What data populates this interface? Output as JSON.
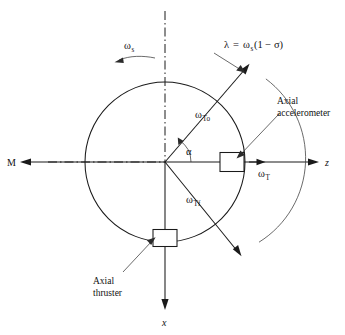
{
  "figure": {
    "type": "engineering-diagram",
    "background_color": "#ffffff",
    "line_color": "#1a1a1a",
    "thin_line_color": "#3a3a3a"
  },
  "axes": {
    "z_axis_label": "z",
    "x_axis_label": "x",
    "moment_label": "M",
    "spin_axis_dashdot": true
  },
  "labels": {
    "spin_rate": "ω",
    "spin_rate_sub": "s",
    "lambda_expression": "λ = ω (1 − σ)",
    "lambda_symbol": "λ",
    "lambda_equals": "=",
    "lambda_omega": "ω",
    "lambda_omega_sub": "s",
    "lambda_tail": "(1 − σ)",
    "omega_To": "ω",
    "omega_To_sub": "To",
    "omega_Tf": "ω",
    "omega_Tf_sub": "Tf",
    "omega_T": "ω",
    "omega_T_sub": "T",
    "alpha": "α",
    "accelerometer_line1": "Axial",
    "accelerometer_line2": "accelerometer",
    "thruster_line1": "Axial",
    "thruster_line2": "thruster"
  },
  "geometry": {
    "center_x": 165,
    "center_y": 162,
    "circle_radius": 80,
    "outer_arc_radius": 99,
    "omega_To_angle_deg": -57,
    "omega_Tf_angle_deg": 52,
    "alpha_arc_radius": 26,
    "accelerometer_box": {
      "x": 232,
      "y": 162,
      "w": 24,
      "h": 19
    },
    "thruster_box": {
      "x": 165,
      "y": 238,
      "w": 24,
      "h": 17
    }
  }
}
